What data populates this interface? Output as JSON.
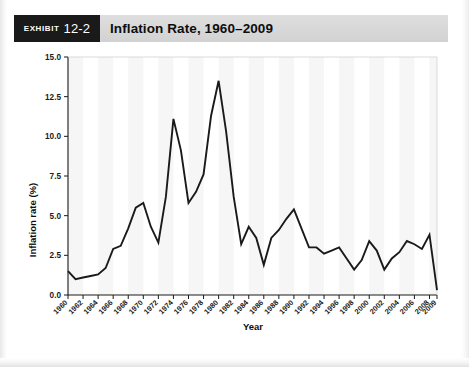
{
  "exhibit": {
    "word": "Exhibit",
    "number": "12-2",
    "title": "Inflation Rate, 1960–2009"
  },
  "chart_data": {
    "type": "line",
    "title": "Inflation Rate, 1960–2009",
    "xlabel": "Year",
    "ylabel": "Inflation rate (%)",
    "ylim": [
      0.0,
      15.0
    ],
    "yticks": [
      "0.0",
      "2.5",
      "5.0",
      "7.5",
      "10.0",
      "12.5",
      "15.0"
    ],
    "xlim": [
      1960,
      2009
    ],
    "xticks": [
      "1960",
      "1962",
      "1964",
      "1966",
      "1968",
      "1970",
      "1972",
      "1974",
      "1976",
      "1978",
      "1980",
      "1982",
      "1984",
      "1986",
      "1988",
      "1990",
      "1992",
      "1994",
      "1996",
      "1998",
      "2000",
      "2002",
      "2004",
      "2006",
      "2008",
      "2009"
    ],
    "grid": false,
    "legend": false,
    "series_color": "#1a1a1a",
    "x": [
      1960,
      1961,
      1962,
      1963,
      1964,
      1965,
      1966,
      1967,
      1968,
      1969,
      1970,
      1971,
      1972,
      1973,
      1974,
      1975,
      1976,
      1977,
      1978,
      1979,
      1980,
      1981,
      1982,
      1983,
      1984,
      1985,
      1986,
      1987,
      1988,
      1989,
      1990,
      1991,
      1992,
      1993,
      1994,
      1995,
      1996,
      1997,
      1998,
      1999,
      2000,
      2001,
      2002,
      2003,
      2004,
      2005,
      2006,
      2007,
      2008,
      2009
    ],
    "values": [
      1.5,
      1.0,
      1.1,
      1.2,
      1.3,
      1.7,
      2.9,
      3.1,
      4.2,
      5.5,
      5.8,
      4.3,
      3.3,
      6.2,
      11.1,
      9.1,
      5.8,
      6.5,
      7.6,
      11.3,
      13.5,
      10.3,
      6.2,
      3.2,
      4.3,
      3.6,
      1.9,
      3.6,
      4.1,
      4.8,
      5.4,
      4.2,
      3.0,
      3.0,
      2.6,
      2.8,
      3.0,
      2.3,
      1.6,
      2.2,
      3.4,
      2.8,
      1.6,
      2.3,
      2.7,
      3.4,
      3.2,
      2.9,
      3.8,
      0.3
    ]
  }
}
